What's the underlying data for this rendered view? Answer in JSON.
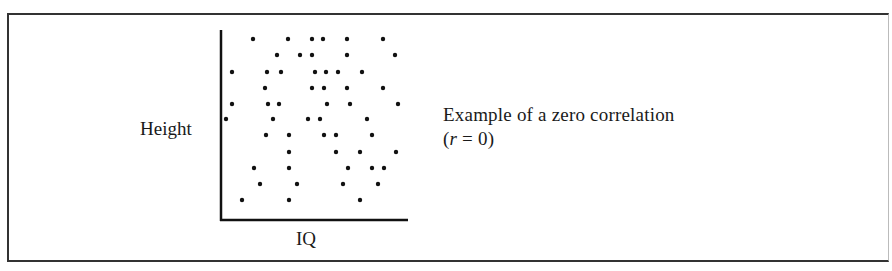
{
  "figure": {
    "caption_line1": "Example of a zero  correlation",
    "caption_line2_prefix": "(",
    "caption_line2_var": "r",
    "caption_line2_suffix": " = 0)",
    "colors": {
      "axis": "#111111",
      "dot": "#111111",
      "frame": "#333333"
    }
  },
  "chart_data": {
    "type": "scatter",
    "title": "Example of a zero correlation (r = 0)",
    "xlabel": "IQ",
    "ylabel": "Height",
    "grid": false,
    "ticks": "none",
    "correlation_r": 0,
    "points_px": [
      [
        253,
        39
      ],
      [
        288,
        39
      ],
      [
        312,
        39
      ],
      [
        323,
        39
      ],
      [
        347,
        39
      ],
      [
        383,
        39
      ],
      [
        277,
        55
      ],
      [
        300,
        55
      ],
      [
        312,
        55
      ],
      [
        347,
        55
      ],
      [
        395,
        55
      ],
      [
        232,
        72
      ],
      [
        267,
        72
      ],
      [
        281,
        72
      ],
      [
        315,
        72
      ],
      [
        326,
        72
      ],
      [
        338,
        72
      ],
      [
        362,
        72
      ],
      [
        265,
        88
      ],
      [
        312,
        88
      ],
      [
        324,
        88
      ],
      [
        347,
        88
      ],
      [
        383,
        88
      ],
      [
        232,
        104
      ],
      [
        268,
        104
      ],
      [
        279,
        104
      ],
      [
        327,
        104
      ],
      [
        350,
        104
      ],
      [
        398,
        104
      ],
      [
        226,
        119
      ],
      [
        273,
        119
      ],
      [
        308,
        119
      ],
      [
        320,
        119
      ],
      [
        367,
        119
      ],
      [
        266,
        135
      ],
      [
        289,
        135
      ],
      [
        324,
        135
      ],
      [
        336,
        135
      ],
      [
        372,
        135
      ],
      [
        289,
        152
      ],
      [
        336,
        152
      ],
      [
        360,
        152
      ],
      [
        396,
        152
      ],
      [
        254,
        168
      ],
      [
        289,
        168
      ],
      [
        348,
        168
      ],
      [
        372,
        168
      ],
      [
        384,
        168
      ],
      [
        260,
        184
      ],
      [
        297,
        184
      ],
      [
        343,
        184
      ],
      [
        378,
        184
      ],
      [
        242,
        200
      ],
      [
        289,
        200
      ],
      [
        360,
        200
      ]
    ],
    "axes_px": {
      "origin": [
        221,
        220
      ],
      "y_top": 30,
      "x_right": 408
    }
  }
}
